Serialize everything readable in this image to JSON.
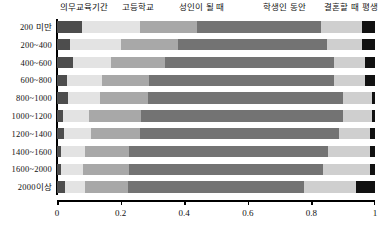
{
  "chart_data": {
    "type": "bar",
    "subtype": "stacked-horizontal-proportional",
    "title": "",
    "xlabel": "",
    "ylabel": "",
    "xlim": [
      0,
      1
    ],
    "xticks": [
      "0",
      "0.2",
      "0.4",
      "0.6",
      "0.8",
      "1"
    ],
    "xtick_values": [
      0,
      0.2,
      0.4,
      0.6,
      0.8,
      1
    ],
    "grid": false,
    "legend_position": "top",
    "categories": [
      "200 미만",
      "200~400",
      "400~600",
      "600~800",
      "800~1000",
      "1000~1200",
      "1200~1400",
      "1400~1600",
      "1600~2000",
      "2000이상"
    ],
    "series": [
      {
        "name": "의무교육기간",
        "color": "#4d4d4d",
        "values": [
          0.08,
          0.042,
          0.05,
          0.03,
          0.035,
          0.02,
          0.022,
          0.012,
          0.014,
          0.026
        ]
      },
      {
        "name": "고등학교",
        "color": "#e3e3e3",
        "values": [
          0.18,
          0.158,
          0.12,
          0.11,
          0.1,
          0.08,
          0.085,
          0.075,
          0.068,
          0.062
        ]
      },
      {
        "name": "성인이 될 때",
        "color": "#a8a8a8",
        "values": [
          0.18,
          0.18,
          0.17,
          0.15,
          0.15,
          0.165,
          0.155,
          0.14,
          0.145,
          0.135
        ]
      },
      {
        "name": "학생인 동안",
        "color": "#737373",
        "values": [
          0.39,
          0.47,
          0.53,
          0.58,
          0.615,
          0.635,
          0.625,
          0.625,
          0.61,
          0.555
        ]
      },
      {
        "name": "결혼할 때",
        "color": "#cfcfcf",
        "values": [
          0.13,
          0.11,
          0.1,
          0.1,
          0.09,
          0.09,
          0.098,
          0.133,
          0.148,
          0.162
        ]
      },
      {
        "name": "평생",
        "color": "#111111",
        "values": [
          0.04,
          0.04,
          0.03,
          0.03,
          0.01,
          0.01,
          0.015,
          0.015,
          0.015,
          0.06
        ]
      }
    ],
    "legend_label_x": [
      0.085,
      0.255,
      0.455,
      0.715,
      0.895,
      0.985
    ]
  }
}
